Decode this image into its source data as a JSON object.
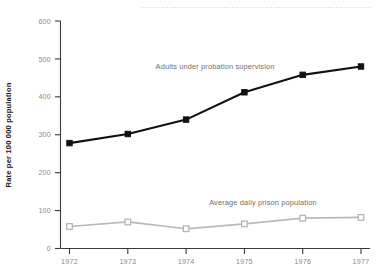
{
  "chart_data": {
    "type": "line",
    "title": "",
    "subtitle": "",
    "xlabel": "",
    "ylabel": "Rate per 100 000 population",
    "x": [
      1972,
      1973,
      1974,
      1975,
      1976,
      1977
    ],
    "categories": [
      "1972",
      "1973",
      "1974",
      "1975",
      "1976",
      "1977"
    ],
    "xlim": [
      1972,
      1977
    ],
    "ylim": [
      0,
      600
    ],
    "y_ticks": [
      0,
      100,
      200,
      300,
      400,
      500,
      600
    ],
    "y_tick_labels": [
      "0",
      "100",
      "200",
      "300",
      "400",
      "500",
      "600"
    ],
    "x_ticks": [
      1972,
      1973,
      1974,
      1975,
      1976,
      1977
    ],
    "x_tick_labels": [
      "1972",
      "1973",
      "1974",
      "1975",
      "1976",
      "1977"
    ],
    "grid": false,
    "legend_position": "inline-series-labels",
    "series": [
      {
        "name": "Adults under probation supervision",
        "label": "Adults under probation supervision",
        "marker": "filled-square",
        "color": "#111111",
        "values": [
          278,
          302,
          340,
          412,
          458,
          480
        ]
      },
      {
        "name": "Average daily prison population",
        "label": "Average daily prison population",
        "marker": "open-square",
        "color": "#b9b9b9",
        "values": [
          58,
          70,
          52,
          65,
          80,
          82
        ]
      }
    ],
    "annotations": [
      {
        "name": "top-dotted-rule",
        "text": ""
      }
    ]
  },
  "colors": {
    "background": "#ffffff",
    "axis": "#3a3a3a",
    "tick_label": "#8a8a8a",
    "axis_title": "#1a1a1a",
    "series_label": "#6e6e6e",
    "series_dark": "#111111",
    "series_light": "#b9b9b9",
    "dotted_rule": "#d8d0cc"
  }
}
